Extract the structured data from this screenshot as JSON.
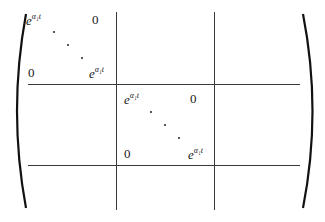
{
  "matrix": {
    "type": "block-diagonal",
    "left_delimiter": "(",
    "right_delimiter": ")",
    "blocks": [
      {
        "top_left": {
          "base": "e",
          "exp": "α₁t"
        },
        "top_right": "0",
        "bottom_left": "0",
        "bottom_right": {
          "base": "e",
          "exp": "α₁t"
        },
        "dots": "⋱"
      },
      {
        "top_left": {
          "base": "e",
          "exp": "α₁t"
        },
        "top_right": "0",
        "bottom_left": "0",
        "bottom_right": {
          "base": "e",
          "exp": "α₁t"
        },
        "dots": "⋱"
      }
    ],
    "grid": {
      "rows": 3,
      "cols": 3
    }
  }
}
